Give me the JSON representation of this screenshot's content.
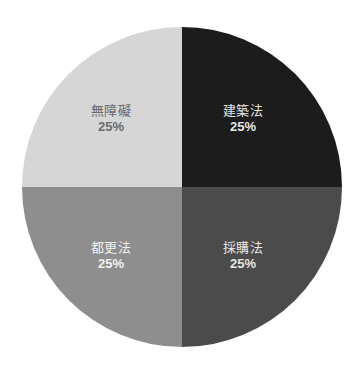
{
  "chart_data": {
    "type": "pie",
    "title": "",
    "categories": [
      "建築法",
      "採購法",
      "都更法",
      "無障礙"
    ],
    "values": [
      25,
      25,
      25,
      25
    ],
    "unit": "%",
    "start_angle_deg": 90,
    "direction": "clockwise",
    "legend": "none",
    "labels_inside": true,
    "colors": [
      "#1c1c1c",
      "#4b4b4b",
      "#8e8e8e",
      "#d6d6d6"
    ],
    "label_colors": [
      "#e6e6e6",
      "#e6e6e6",
      "#f2f2f2",
      "#6a6a6a"
    ]
  },
  "slices": [
    {
      "name": "建築法",
      "percent": "25%",
      "color": "#1c1c1c",
      "label_color": "#e6e6e6"
    },
    {
      "name": "採購法",
      "percent": "25%",
      "color": "#4b4b4b",
      "label_color": "#e6e6e6"
    },
    {
      "name": "都更法",
      "percent": "25%",
      "color": "#8e8e8e",
      "label_color": "#f2f2f2"
    },
    {
      "name": "無障礙",
      "percent": "25%",
      "color": "#d6d6d6",
      "label_color": "#6a6a6a"
    }
  ]
}
